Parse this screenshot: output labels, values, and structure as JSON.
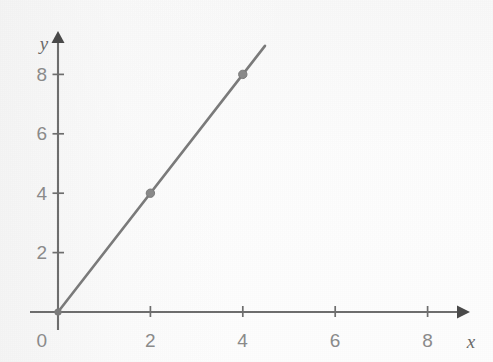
{
  "chart_data": {
    "type": "line",
    "title": "",
    "subtitle": "",
    "xlabel": "x",
    "ylabel": "y",
    "xlim": [
      0,
      9
    ],
    "ylim": [
      0,
      9.4
    ],
    "grid": false,
    "legend": "none",
    "x_ticks": [
      {
        "value": 2,
        "label": "2"
      },
      {
        "value": 4,
        "label": "4"
      },
      {
        "value": 6,
        "label": "6"
      },
      {
        "value": 8,
        "label": "8"
      }
    ],
    "y_ticks": [
      {
        "value": 2,
        "label": "2"
      },
      {
        "value": 4,
        "label": "4"
      },
      {
        "value": 6,
        "label": "6"
      },
      {
        "value": 8,
        "label": "8"
      }
    ],
    "origin_label": "0",
    "series": [
      {
        "name": "y = 2x",
        "color": "#7b7b7b",
        "line_from": {
          "x": 0,
          "y": 0
        },
        "line_to": {
          "x": 4.48,
          "y": 8.96
        },
        "slope": 2,
        "intercept": 0,
        "markers": [
          {
            "x": 0,
            "y": 0
          },
          {
            "x": 2,
            "y": 4
          },
          {
            "x": 4,
            "y": 8
          }
        ]
      }
    ],
    "colors": {
      "axis": "#6e6e6e",
      "arrowhead": "#4a4a4a",
      "line": "#7b7b7b",
      "marker": "#8a8a8a",
      "tick_label": "#8b8b8b",
      "axis_name": "#6a6a6a",
      "background": "#fdfdfd"
    }
  },
  "geometry": {
    "origin_px": {
      "x": 58,
      "y": 312
    },
    "x_unit_px": 46.2,
    "y_unit_px": 29.7,
    "x_axis_left_px": 30,
    "x_axis_right_px": 459,
    "y_axis_top_px": 41,
    "y_axis_bottom_px": 330
  }
}
